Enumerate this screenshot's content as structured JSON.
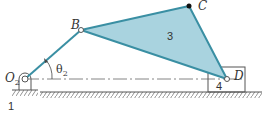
{
  "diagram": {
    "type": "four-bar slider-crank mechanism",
    "colors": {
      "link": "#3a8fa3",
      "fill": "#a9d3df",
      "line": "#555555"
    },
    "points": {
      "O2": {
        "label": "O",
        "subscript": "2"
      },
      "B": {
        "label": "B"
      },
      "C": {
        "label": "C"
      },
      "D": {
        "label": "D"
      }
    },
    "angle": {
      "label": "θ",
      "subscript": "2"
    },
    "links": {
      "ground": "1",
      "coupler": "3",
      "slider": "4"
    }
  }
}
